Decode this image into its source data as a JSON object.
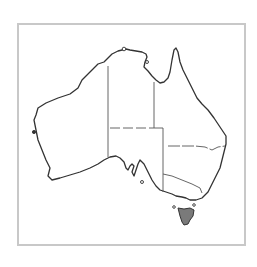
{
  "map": {
    "title": "Australia",
    "highlighted_region": "Tasmania",
    "regions": [
      {
        "name": "Western Australia",
        "highlighted": false
      },
      {
        "name": "Northern Territory",
        "highlighted": false
      },
      {
        "name": "Queensland",
        "highlighted": false
      },
      {
        "name": "South Australia",
        "highlighted": false
      },
      {
        "name": "New South Wales",
        "highlighted": false
      },
      {
        "name": "Victoria",
        "highlighted": false
      },
      {
        "name": "Tasmania",
        "highlighted": true
      }
    ],
    "colors": {
      "outline": "#333333",
      "border": "#555555",
      "frame": "#c8c8c8",
      "highlight": "#7a7a7a",
      "land": "#ffffff"
    }
  }
}
